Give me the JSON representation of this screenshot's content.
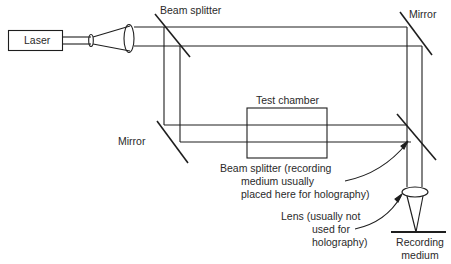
{
  "diagram": {
    "components": {
      "laser": {
        "label": "Laser"
      },
      "beam_splitter_top": {
        "label": "Beam splitter"
      },
      "mirror_top_right": {
        "label": "Mirror"
      },
      "mirror_left": {
        "label": "Mirror"
      },
      "test_chamber": {
        "label": "Test chamber"
      },
      "beam_splitter_bottom": {
        "label_lines": [
          "Beam splitter (recording",
          "medium usually",
          "placed here for holography)"
        ]
      },
      "lens": {
        "label_lines": [
          "Lens (usually not",
          "used for",
          "holography)"
        ]
      },
      "recording_medium": {
        "label_lines": [
          "Recording",
          "medium"
        ]
      }
    },
    "colors": {
      "line": "#1e1e1e",
      "text": "#2a2a2a",
      "background": "#ffffff"
    }
  }
}
